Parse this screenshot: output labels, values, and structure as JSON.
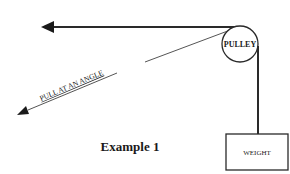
{
  "diagram": {
    "title": "Example 1",
    "pulley_label": "PULLEY",
    "weight_label": "WEIGHT",
    "angle_label": "PULL AT AN ANGLE",
    "colors": {
      "stroke": "#2a2a2a",
      "thin_line": "#555555",
      "background": "#ffffff"
    }
  }
}
